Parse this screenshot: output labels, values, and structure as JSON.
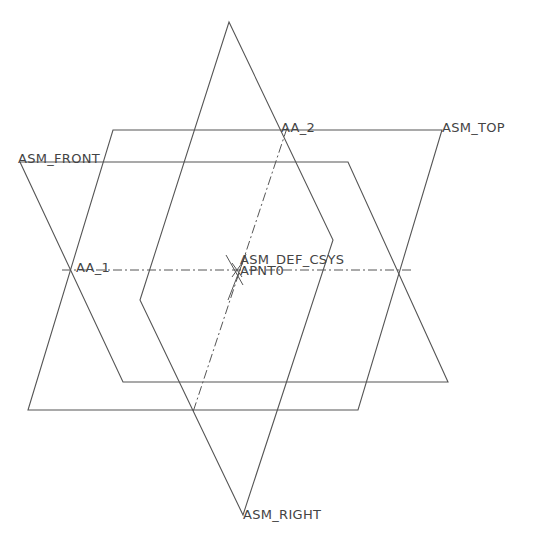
{
  "viewport": {
    "line_color": "#555555",
    "label_color": "#444444",
    "background": "#ffffff"
  },
  "labels": {
    "asm_front": "ASM_FRONT",
    "asm_top": "ASM_TOP",
    "asm_right": "ASM_RIGHT",
    "aa_1": "AA_1",
    "aa_2": "AA_2",
    "asm_def_csys": "ASM_DEF_CSYS",
    "apnt0": "APNT0"
  },
  "datum_planes": [
    {
      "name": "ASM_TOP",
      "points": [
        [
          113,
          130
        ],
        [
          442,
          130
        ],
        [
          358,
          410
        ],
        [
          28,
          410
        ]
      ]
    },
    {
      "name": "ASM_FRONT",
      "points": [
        [
          20,
          162
        ],
        [
          348,
          162
        ],
        [
          448,
          382
        ],
        [
          123,
          382
        ]
      ]
    },
    {
      "name": "ASM_RIGHT",
      "points": [
        [
          229,
          22
        ],
        [
          333,
          240
        ],
        [
          243,
          515
        ],
        [
          140,
          300
        ]
      ]
    }
  ],
  "datum_axes": [
    {
      "name": "AA_1",
      "from": [
        62,
        270
      ],
      "to": [
        412,
        270
      ]
    },
    {
      "name": "AA_2",
      "from": [
        287,
        128
      ],
      "to": [
        193,
        412
      ]
    }
  ]
}
